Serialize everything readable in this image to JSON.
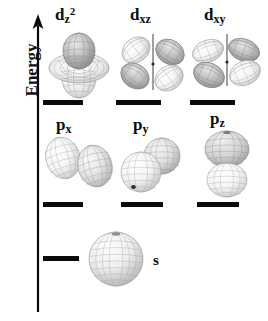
{
  "figure": {
    "background_color": "#ffffff",
    "ink_color": "#0a0a0a"
  },
  "axis": {
    "label": "Energy",
    "icon": "up-arrow-icon",
    "direction": "up"
  },
  "rows": [
    {
      "row_name": "d-orbitals",
      "orbitals": [
        {
          "label_base": "d",
          "sub": "z",
          "sup": "2",
          "name": "d-z2"
        },
        {
          "label_base": "d",
          "sub": "xz",
          "sup": "",
          "name": "d-xz"
        },
        {
          "label_base": "d",
          "sub": "xy",
          "sup": "",
          "name": "d-xy"
        }
      ]
    },
    {
      "row_name": "p-orbitals",
      "orbitals": [
        {
          "label_base": "p",
          "sub": "x",
          "sup": "",
          "name": "p-x"
        },
        {
          "label_base": "p",
          "sub": "y",
          "sup": "",
          "name": "p-y"
        },
        {
          "label_base": "p",
          "sub": "z",
          "sup": "",
          "name": "p-z"
        }
      ]
    },
    {
      "row_name": "s-orbital",
      "orbitals": [
        {
          "label_base": "s",
          "sub": "",
          "sup": "",
          "name": "s"
        }
      ]
    }
  ],
  "labels": {
    "d_z2_base": "d",
    "d_z2_sub": "z",
    "d_z2_sup": "2",
    "d_xz_base": "d",
    "d_xz_sub": "xz",
    "d_xy_base": "d",
    "d_xy_sub": "xy",
    "p_x_base": "p",
    "p_x_sub": "x",
    "p_y_base": "p",
    "p_y_sub": "y",
    "p_z_base": "p",
    "p_z_sub": "z",
    "s_label": "s"
  },
  "energy_levels": [
    {
      "name": "level-d-z2",
      "row": "d",
      "x": 43,
      "y": 100,
      "width": 40
    },
    {
      "name": "level-d-xz",
      "row": "d",
      "x": 116,
      "y": 100,
      "width": 45
    },
    {
      "name": "level-d-xy",
      "row": "d",
      "x": 190,
      "y": 100,
      "width": 45
    },
    {
      "name": "level-p-x",
      "row": "p",
      "x": 43,
      "y": 202,
      "width": 40
    },
    {
      "name": "level-p-y",
      "row": "p",
      "x": 121,
      "y": 202,
      "width": 42
    },
    {
      "name": "level-p-z",
      "row": "p",
      "x": 197,
      "y": 202,
      "width": 42
    },
    {
      "name": "level-s",
      "row": "s",
      "x": 43,
      "y": 256,
      "width": 36
    }
  ]
}
